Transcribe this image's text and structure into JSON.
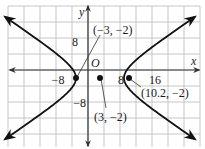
{
  "graph": {
    "type": "hyperbola",
    "equation": "(x-3)^2/36 - (y+2)^2/16 = 1",
    "center": [
      3,
      -2
    ],
    "a": 6,
    "b": 4,
    "grid_unit": 4,
    "x_range": [
      -20,
      28
    ],
    "y_range": [
      -19,
      16
    ],
    "colors": {
      "grid": "#b9b9b9",
      "axis": "#333333",
      "curve": "#111111",
      "background": "#ffffff"
    }
  },
  "axes": {
    "x_label": "x",
    "y_label": "y",
    "origin_label": "O",
    "x_ticks": [
      {
        "value": -8,
        "label": "−8"
      },
      {
        "value": 8,
        "label": "8"
      },
      {
        "value": 16,
        "label": "16"
      }
    ],
    "y_ticks": [
      {
        "value": 8,
        "label": "8"
      },
      {
        "value": -8,
        "label": "−8"
      }
    ]
  },
  "points": [
    {
      "x": -3,
      "y": -2,
      "label": "(−3, −2)"
    },
    {
      "x": 3,
      "y": -2,
      "label": "(3, −2)"
    },
    {
      "x": 10.2,
      "y": -2,
      "label": "(10.2, −2)"
    }
  ]
}
